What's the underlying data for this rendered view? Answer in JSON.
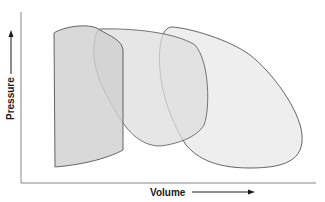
{
  "diagram": {
    "x_axis_label": "Volume",
    "y_axis_label": "Pressure",
    "loops": [
      {
        "name": "narrow-loop",
        "fill": "#cfcfcf",
        "stroke": "#555555"
      },
      {
        "name": "middle-loop",
        "fill": "#dedede",
        "stroke": "#666666"
      },
      {
        "name": "wide-loop",
        "fill": "#ebebeb",
        "stroke": "#555555"
      }
    ],
    "colors": {
      "axis": "#888888",
      "text": "#1a1a1a",
      "background": "#ffffff"
    }
  }
}
